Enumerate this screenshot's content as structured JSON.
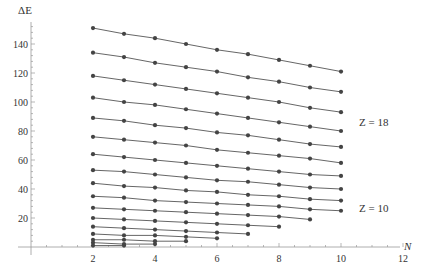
{
  "chart_data": {
    "type": "line",
    "title": "",
    "xlabel": "N",
    "ylabel": "ΔE",
    "xlim": [
      0,
      12
    ],
    "ylim": [
      0,
      155
    ],
    "x_ticks": [
      2,
      4,
      6,
      8,
      10,
      12
    ],
    "y_ticks": [
      20,
      40,
      60,
      80,
      100,
      120,
      140
    ],
    "grid": false,
    "legend": "none",
    "annotations": [
      {
        "text": "Z = 18",
        "x": 10.6,
        "y": 121
      },
      {
        "text": "Z = 10",
        "x": 10.6,
        "y": 27
      }
    ],
    "series": [
      {
        "name": "Z=18",
        "x": [
          2,
          3,
          4,
          5,
          6,
          7,
          8,
          9,
          10
        ],
        "values": [
          151,
          147,
          144,
          140,
          136,
          133,
          129,
          125,
          121
        ]
      },
      {
        "name": "Z=17",
        "x": [
          2,
          3,
          4,
          5,
          6,
          7,
          8,
          9,
          10
        ],
        "values": [
          134,
          131,
          127,
          124,
          121,
          117,
          114,
          110,
          107
        ]
      },
      {
        "name": "Z=16",
        "x": [
          2,
          3,
          4,
          5,
          6,
          7,
          8,
          9,
          10
        ],
        "values": [
          118,
          115,
          112,
          109,
          106,
          103,
          100,
          96,
          93
        ]
      },
      {
        "name": "Z=15",
        "x": [
          2,
          3,
          4,
          5,
          6,
          7,
          8,
          9,
          10
        ],
        "values": [
          103,
          100,
          98,
          95,
          92,
          89,
          86,
          83,
          80
        ]
      },
      {
        "name": "Z=14",
        "x": [
          2,
          3,
          4,
          5,
          6,
          7,
          8,
          9,
          10
        ],
        "values": [
          89,
          87,
          84,
          82,
          79,
          77,
          74,
          71,
          69
        ]
      },
      {
        "name": "Z=13",
        "x": [
          2,
          3,
          4,
          5,
          6,
          7,
          8,
          9,
          10
        ],
        "values": [
          76,
          74,
          72,
          70,
          67,
          65,
          63,
          61,
          58
        ]
      },
      {
        "name": "Z=12",
        "x": [
          2,
          3,
          4,
          5,
          6,
          7,
          8,
          9,
          10
        ],
        "values": [
          64,
          62,
          60,
          58,
          56,
          54,
          52,
          50,
          49
        ]
      },
      {
        "name": "Z=11",
        "x": [
          2,
          3,
          4,
          5,
          6,
          7,
          8,
          9,
          10
        ],
        "values": [
          53,
          52,
          50,
          48,
          46,
          45,
          43,
          41,
          40
        ]
      },
      {
        "name": "Z=10",
        "x": [
          2,
          3,
          4,
          5,
          6,
          7,
          8,
          9,
          10
        ],
        "values": [
          44,
          42,
          41,
          39,
          38,
          36,
          35,
          33,
          32
        ]
      },
      {
        "name": "Z=9",
        "x": [
          2,
          3,
          4,
          5,
          6,
          7,
          8,
          9,
          10
        ],
        "values": [
          35,
          34,
          32,
          31,
          30,
          29,
          28,
          26,
          25
        ]
      },
      {
        "name": "Z=8",
        "x": [
          2,
          3,
          4,
          5,
          6,
          7,
          8,
          9
        ],
        "values": [
          27,
          26,
          25,
          24,
          23,
          22,
          21,
          19
        ]
      },
      {
        "name": "Z=7",
        "x": [
          2,
          3,
          4,
          5,
          6,
          7,
          8
        ],
        "values": [
          20,
          19,
          18,
          17,
          16,
          15,
          14
        ]
      },
      {
        "name": "Z=6",
        "x": [
          2,
          3,
          4,
          5,
          6,
          7
        ],
        "values": [
          14,
          13,
          12,
          11,
          10,
          9
        ]
      },
      {
        "name": "Z=5",
        "x": [
          2,
          3,
          4,
          5,
          6
        ],
        "values": [
          9,
          8,
          8,
          7,
          6
        ]
      },
      {
        "name": "Z=4",
        "x": [
          2,
          3,
          4,
          5
        ],
        "values": [
          5,
          5,
          4,
          4
        ]
      },
      {
        "name": "Z=3",
        "x": [
          2,
          3,
          4
        ],
        "values": [
          3,
          2,
          2
        ]
      },
      {
        "name": "Z=2",
        "x": [
          2,
          3
        ],
        "values": [
          1,
          1
        ]
      }
    ]
  },
  "axes": {
    "x_label": "N",
    "y_label": "ΔE"
  },
  "labels": {
    "z_top": "Z = 18",
    "z_mid": "Z = 10"
  }
}
